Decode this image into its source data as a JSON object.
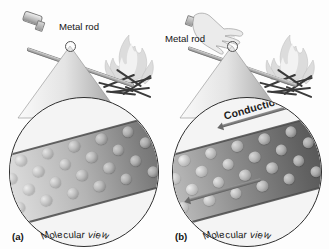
{
  "figure": {
    "domain": "science-diagram",
    "title_text": "",
    "background_color": "#fdfdfd",
    "ink_color": "#1d1d1d"
  },
  "panels": [
    {
      "id": "a",
      "letter": "(a)",
      "rod_label": "Metal rod",
      "magnifier_caption": "Molecular view",
      "has_hand": false,
      "conduction_label": null,
      "arrows": [],
      "description_icons": {
        "fire": "flame-icon",
        "logs": "firewood-icon",
        "rod": "metal-rod-icon",
        "cone": "magnifier-cone-icon",
        "circle": "molecular-view-circle"
      },
      "molecule_grid": {
        "rows": 4,
        "cols": 9,
        "gradient_from": "#efefef",
        "gradient_to": "#5e5e5e"
      }
    },
    {
      "id": "b",
      "letter": "(b)",
      "rod_label": "Metal rod",
      "magnifier_caption": "Molecular view",
      "has_hand": true,
      "conduction_label": "Conduction",
      "arrows": [
        {
          "name": "conduction-arrow-top",
          "direction": "up-left"
        },
        {
          "name": "conduction-arrow-bottom",
          "direction": "up-left"
        }
      ],
      "description_icons": {
        "fire": "flame-icon",
        "logs": "firewood-icon",
        "rod": "metal-rod-icon",
        "hand": "hand-icon",
        "cone": "magnifier-cone-icon",
        "circle": "molecular-view-circle"
      },
      "molecule_grid": {
        "rows": 4,
        "cols": 9,
        "gradient_from": "#d8d8d8",
        "gradient_to": "#4a4a4a"
      }
    }
  ],
  "colors": {
    "flame": "#d9d9d9",
    "flame_core": "#f0f0f0",
    "log": "#3a3a3a",
    "rod_light": "#e8e8e8",
    "rod_dark": "#7d7d7d",
    "circle_stroke": "#2f2f2f",
    "band_hot": "#4a4a4a",
    "band_cool": "#ededed",
    "arrow": "#6a6a6a"
  }
}
